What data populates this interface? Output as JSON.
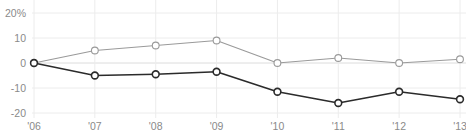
{
  "chart_data": {
    "type": "line",
    "title": "",
    "xlabel": "",
    "ylabel": "",
    "categories": [
      "'06",
      "'07",
      "'08",
      "'09",
      "'10",
      "'11",
      "'12",
      "'13"
    ],
    "ytick_labels": [
      "20%",
      "10",
      "0",
      "-10",
      "-20"
    ],
    "ytick_values": [
      20,
      10,
      0,
      -10,
      -20
    ],
    "ylim": [
      -22,
      21
    ],
    "grid": true,
    "grid_vertical": true,
    "grid_horizontal": true,
    "legend": "none",
    "zero_line": 0,
    "series": [
      {
        "name": "upper-series",
        "color": "#9a9a9a",
        "marker": "open-circle",
        "values": [
          0,
          5,
          7,
          9,
          0,
          2,
          0,
          1.5
        ]
      },
      {
        "name": "lower-series",
        "color": "#2b2b2b",
        "marker": "open-circle",
        "values": [
          0,
          -5,
          -4.5,
          -3.5,
          -11.5,
          -16,
          -11.5,
          -14.5
        ]
      }
    ]
  },
  "colors": {
    "background": "#ffffff",
    "grid": "#ececec",
    "axis_text": "#8a8a8a",
    "upper_line": "#9a9a9a",
    "lower_line": "#2b2b2b",
    "marker_fill": "#ffffff"
  },
  "clipped_title": ""
}
